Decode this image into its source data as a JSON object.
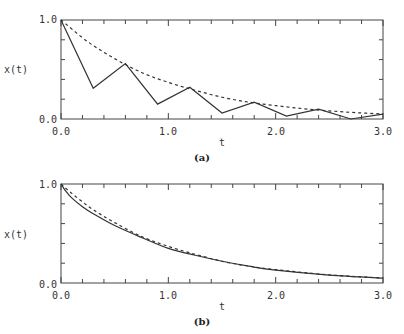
{
  "chart_data": [
    {
      "panel": "(a)",
      "type": "line",
      "title": "",
      "xlabel": "t",
      "ylabel": "x(t)",
      "xlim": [
        0.0,
        3.0
      ],
      "ylim": [
        0.0,
        1.0
      ],
      "xticks": [
        "0.0",
        "1.0",
        "2.0",
        "3.0"
      ],
      "yticks": [
        "0.0",
        "1.0"
      ],
      "grid": false,
      "legend": null,
      "series": [
        {
          "name": "solid",
          "style": "solid",
          "x": [
            0.0,
            0.3,
            0.6,
            0.9,
            1.2,
            1.5,
            1.8,
            2.1,
            2.4,
            2.7,
            3.0
          ],
          "y": [
            1.0,
            0.31,
            0.56,
            0.15,
            0.32,
            0.06,
            0.17,
            0.03,
            0.1,
            0.0,
            0.05
          ]
        },
        {
          "name": "dashed",
          "style": "dashed",
          "x": [
            0.0,
            0.25,
            0.5,
            0.75,
            1.0,
            1.25,
            1.5,
            1.75,
            2.0,
            2.25,
            2.5,
            2.75,
            3.0
          ],
          "y": [
            1.0,
            0.78,
            0.61,
            0.47,
            0.37,
            0.29,
            0.22,
            0.17,
            0.135,
            0.105,
            0.082,
            0.064,
            0.05
          ]
        }
      ]
    },
    {
      "panel": "(b)",
      "type": "line",
      "title": "",
      "xlabel": "t",
      "ylabel": "x(t)",
      "xlim": [
        0.0,
        3.0
      ],
      "ylim": [
        0.0,
        1.0
      ],
      "xticks": [
        "0.0",
        "1.0",
        "2.0",
        "3.0"
      ],
      "yticks": [
        "0.0",
        "1.0"
      ],
      "grid": false,
      "legend": null,
      "series": [
        {
          "name": "solid",
          "style": "solid",
          "x": [
            0.0,
            0.05,
            0.1,
            0.2,
            0.3,
            0.5,
            0.75,
            1.0,
            1.25,
            1.5,
            1.75,
            2.0,
            2.5,
            3.0
          ],
          "y": [
            1.0,
            0.92,
            0.86,
            0.77,
            0.7,
            0.58,
            0.46,
            0.35,
            0.28,
            0.22,
            0.17,
            0.13,
            0.08,
            0.05
          ]
        },
        {
          "name": "dashed",
          "style": "dashed",
          "x": [
            0.0,
            0.1,
            0.2,
            0.3,
            0.5,
            0.75,
            1.0,
            1.25,
            1.5,
            1.75,
            2.0,
            2.5,
            3.0
          ],
          "y": [
            1.0,
            0.905,
            0.82,
            0.74,
            0.61,
            0.47,
            0.37,
            0.29,
            0.22,
            0.17,
            0.135,
            0.082,
            0.05
          ]
        }
      ]
    }
  ],
  "panels": [
    {
      "caption": "(a)",
      "ylabel": "x(t)",
      "xlabel": "t",
      "ytick_top": "1.0",
      "ytick_bottom": "0.0",
      "xtick_labels": [
        "0.0",
        "1.0",
        "2.0",
        "3.0"
      ]
    },
    {
      "caption": "(b)",
      "ylabel": "x(t)",
      "xlabel": "t",
      "ytick_top": "1.0",
      "ytick_bottom": "0.0",
      "xtick_labels": [
        "0.0",
        "1.0",
        "2.0",
        "3.0"
      ]
    }
  ],
  "colors": {
    "line": "#333333",
    "frame": "#444444",
    "text": "#333333"
  }
}
